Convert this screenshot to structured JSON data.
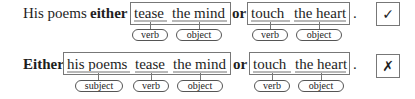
{
  "sentence1": {
    "prefix": "His poems",
    "conj1": "either",
    "box1": [
      "tease",
      "the mind"
    ],
    "conj2": "or",
    "box2": [
      "touch",
      "the heart"
    ],
    "period": ".",
    "labels1": [
      "verb",
      "object"
    ],
    "labels2": [
      "verb",
      "object"
    ],
    "verdict": "✓",
    "verdict_name": "check-icon"
  },
  "sentence2": {
    "conj1": "Either",
    "box1": [
      "his poems",
      "tease",
      "the mind"
    ],
    "conj2": "or",
    "box2": [
      "touch",
      "the heart"
    ],
    "period": ".",
    "labels1": [
      "subject",
      "verb",
      "object"
    ],
    "labels2": [
      "verb",
      "object"
    ],
    "verdict": "✗",
    "verdict_name": "cross-icon"
  }
}
